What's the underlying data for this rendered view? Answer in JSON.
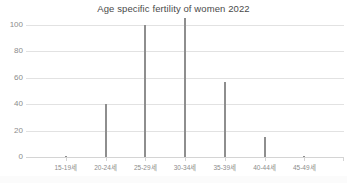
{
  "chart_data": {
    "type": "bar",
    "title": "Age specific fertility of women 2022",
    "xlabel": "",
    "ylabel": "",
    "categories": [
      "15-19세",
      "20-24세",
      "25-29세",
      "30-34세",
      "35-39세",
      "40-44세",
      "45-49세"
    ],
    "values": [
      1,
      40,
      100,
      105,
      57,
      15,
      0.5
    ],
    "ylim": [
      0,
      100
    ],
    "yticks": [
      0,
      20,
      40,
      60,
      80,
      100
    ],
    "ytick_labels": [
      "0",
      "20",
      "40",
      "60",
      "80",
      "100"
    ],
    "grid": true,
    "legend": false,
    "bar_color": "#8e8e8e",
    "gridline_color": "#e2e2e2",
    "axis_text_color": "#8c8c8c",
    "title_color": "#4a4a4a",
    "background": "#ffffff"
  }
}
